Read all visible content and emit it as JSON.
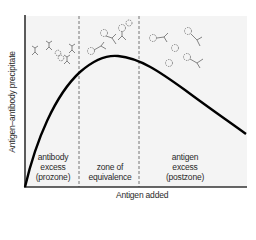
{
  "diagram": {
    "x_axis_label": "Antigen added",
    "y_axis_label": "Antigen–antibody precipitate",
    "zones": [
      {
        "id": "prozone",
        "lines": [
          "antibody",
          "excess",
          "(prozone)"
        ]
      },
      {
        "id": "equivalence",
        "lines": [
          "zone of",
          "equivalence"
        ]
      },
      {
        "id": "postzone",
        "lines": [
          "antigen",
          "excess",
          "(postzone)"
        ]
      }
    ],
    "curve": {
      "description": "Precipitate rises steeply from origin, peaks in the zone of equivalence, then declines in antigen excess",
      "color": "#000000"
    },
    "molecule_illustrations": [
      {
        "zone": "prozone",
        "content": "Y-shaped antibodies with few antigens"
      },
      {
        "zone": "equivalence",
        "content": "Lattice of antibodies cross-linked with antigens"
      },
      {
        "zone": "postzone",
        "content": "Antigens in excess with few antibodies"
      }
    ],
    "colors": {
      "background": "#f4f4f4",
      "axis": "#333333",
      "divider": "#666666",
      "molecule": "#888888"
    }
  }
}
